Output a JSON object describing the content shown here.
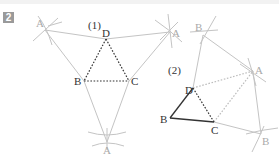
{
  "problem": {
    "number": "2"
  },
  "figure1": {
    "label": "(1)",
    "points": {
      "A1": {
        "name": "A",
        "x": 45,
        "y": 30
      },
      "A2": {
        "name": "A",
        "x": 170,
        "y": 32
      },
      "A3": {
        "name": "A",
        "x": 107,
        "y": 142
      },
      "D": {
        "name": "D",
        "x": 106,
        "y": 39
      },
      "B": {
        "name": "B",
        "x": 84,
        "y": 81
      },
      "C": {
        "name": "C",
        "x": 129,
        "y": 81
      }
    }
  },
  "figure2": {
    "label": "(2)",
    "points": {
      "B1": {
        "name": "B",
        "x": 203,
        "y": 35
      },
      "A": {
        "name": "A",
        "x": 253,
        "y": 71
      },
      "B2": {
        "name": "B",
        "x": 261,
        "y": 134
      },
      "D": {
        "name": "D",
        "x": 193,
        "y": 88
      },
      "B": {
        "name": "B",
        "x": 170,
        "y": 118
      },
      "C": {
        "name": "C",
        "x": 214,
        "y": 122
      }
    }
  },
  "colors": {
    "construction": "#c4c4c4",
    "solid": "#333333",
    "dotted_dark": "#333333",
    "dotted_light": "#bdbdbd",
    "badge": "#9a9a9a"
  }
}
